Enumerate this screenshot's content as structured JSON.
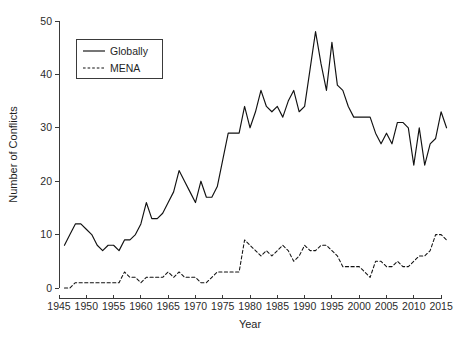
{
  "chart_data": {
    "type": "line",
    "title": "",
    "xlabel": "Year",
    "ylabel": "Number of Conflicts",
    "xlim": [
      1945,
      2017
    ],
    "ylim": [
      0,
      50
    ],
    "grid": false,
    "legend_position": "top-left",
    "xticks": [
      "1945",
      "1950",
      "1955",
      "1960",
      "1965",
      "1970",
      "1975",
      "1980",
      "1985",
      "1990",
      "1995",
      "2000",
      "2005",
      "2010",
      "2015"
    ],
    "xtick_values": [
      1945,
      1950,
      1955,
      1960,
      1965,
      1970,
      1975,
      1980,
      1985,
      1990,
      1995,
      2000,
      2005,
      2010,
      2015
    ],
    "yticks": [
      "0",
      "10",
      "20",
      "30",
      "40",
      "50"
    ],
    "ytick_values": [
      0,
      10,
      20,
      30,
      40,
      50
    ],
    "x": [
      1946,
      1947,
      1948,
      1949,
      1950,
      1951,
      1952,
      1953,
      1954,
      1955,
      1956,
      1957,
      1958,
      1959,
      1960,
      1961,
      1962,
      1963,
      1964,
      1965,
      1966,
      1967,
      1968,
      1969,
      1970,
      1971,
      1972,
      1973,
      1974,
      1975,
      1976,
      1977,
      1978,
      1979,
      1980,
      1981,
      1982,
      1983,
      1984,
      1985,
      1986,
      1987,
      1988,
      1989,
      1990,
      1991,
      1992,
      1993,
      1994,
      1995,
      1996,
      1997,
      1998,
      1999,
      2000,
      2001,
      2002,
      2003,
      2004,
      2005,
      2006,
      2007,
      2008,
      2009,
      2010,
      2011,
      2012,
      2013,
      2014,
      2015,
      2016
    ],
    "series": [
      {
        "name": "Globally",
        "style": "solid",
        "color": "#111111",
        "values": [
          8,
          10,
          12,
          12,
          11,
          10,
          8,
          7,
          8,
          8,
          7,
          9,
          9,
          10,
          12,
          16,
          13,
          13,
          14,
          16,
          18,
          22,
          20,
          18,
          16,
          20,
          17,
          17,
          19,
          24,
          29,
          29,
          29,
          34,
          30,
          33,
          37,
          34,
          33,
          34,
          32,
          35,
          37,
          33,
          34,
          41,
          48,
          42,
          37,
          46,
          38,
          37,
          34,
          32,
          32,
          32,
          32,
          29,
          27,
          29,
          27,
          31,
          31,
          30,
          23,
          30,
          23,
          27,
          28,
          33,
          30
        ]
      },
      {
        "name": "MENA",
        "style": "dashed",
        "color": "#111111",
        "values": [
          0,
          0,
          1,
          1,
          1,
          1,
          1,
          1,
          1,
          1,
          1,
          3,
          2,
          2,
          1,
          2,
          2,
          2,
          2,
          3,
          2,
          3,
          2,
          2,
          2,
          1,
          1,
          2,
          3,
          3,
          3,
          3,
          3,
          9,
          8,
          7,
          6,
          7,
          6,
          7,
          8,
          7,
          5,
          6,
          8,
          7,
          7,
          8,
          8,
          7,
          6,
          4,
          4,
          4,
          4,
          3,
          2,
          5,
          5,
          4,
          4,
          5,
          4,
          4,
          5,
          6,
          6,
          7,
          10,
          10,
          9
        ]
      }
    ]
  },
  "legend": {
    "entries": [
      {
        "label": "Globally"
      },
      {
        "label": "MENA"
      }
    ]
  }
}
